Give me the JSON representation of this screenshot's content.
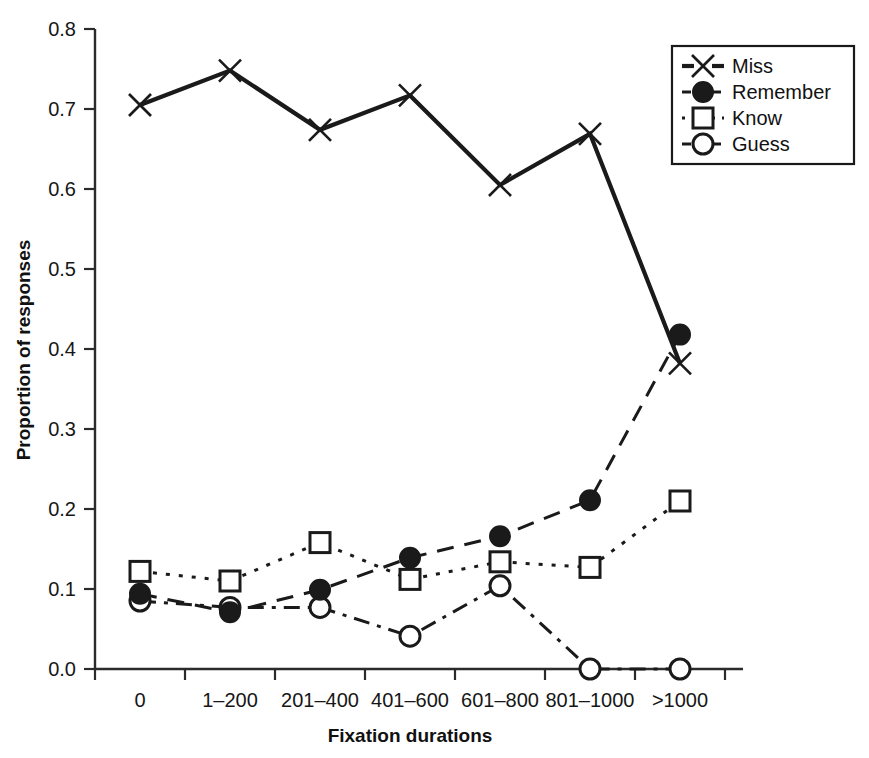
{
  "chart_data": {
    "type": "line",
    "title": "",
    "xlabel": "Fixation durations",
    "ylabel": "Proportion of responses",
    "categories": [
      "0",
      "1–200",
      "201–400",
      "401–600",
      "601–800",
      "801–1000",
      ">1000"
    ],
    "ylim": [
      0.0,
      0.8
    ],
    "ytick_labels": [
      "0.0",
      "0.1",
      "0.2",
      "0.3",
      "0.4",
      "0.5",
      "0.6",
      "0.7",
      "0.8"
    ],
    "ytick_values": [
      0.0,
      0.1,
      0.2,
      0.3,
      0.4,
      0.5,
      0.6,
      0.7,
      0.8
    ],
    "grid": false,
    "legend_position": "top-right",
    "series": [
      {
        "name": "Miss",
        "marker": "x",
        "line_style": "solid",
        "color": "#1a1a1a",
        "values": [
          0.705,
          0.748,
          0.674,
          0.717,
          0.605,
          0.669,
          0.382
        ]
      },
      {
        "name": "Remember",
        "marker": "filled-circle",
        "line_style": "dashed",
        "color": "#1a1a1a",
        "values": [
          0.094,
          0.071,
          0.099,
          0.139,
          0.166,
          0.211,
          0.418
        ]
      },
      {
        "name": "Know",
        "marker": "open-square",
        "line_style": "dotted",
        "color": "#1a1a1a",
        "values": [
          0.122,
          0.11,
          0.158,
          0.112,
          0.134,
          0.127,
          0.21
        ]
      },
      {
        "name": "Guess",
        "marker": "open-circle",
        "line_style": "dash-dot",
        "color": "#1a1a1a",
        "values": [
          0.085,
          0.077,
          0.077,
          0.041,
          0.104,
          0.0,
          0.0
        ]
      }
    ]
  },
  "legend": {
    "items": [
      {
        "label": "Miss"
      },
      {
        "label": "Remember"
      },
      {
        "label": "Know"
      },
      {
        "label": "Guess"
      }
    ]
  },
  "axes": {
    "x_title": "Fixation durations",
    "y_title": "Proportion of responses"
  }
}
